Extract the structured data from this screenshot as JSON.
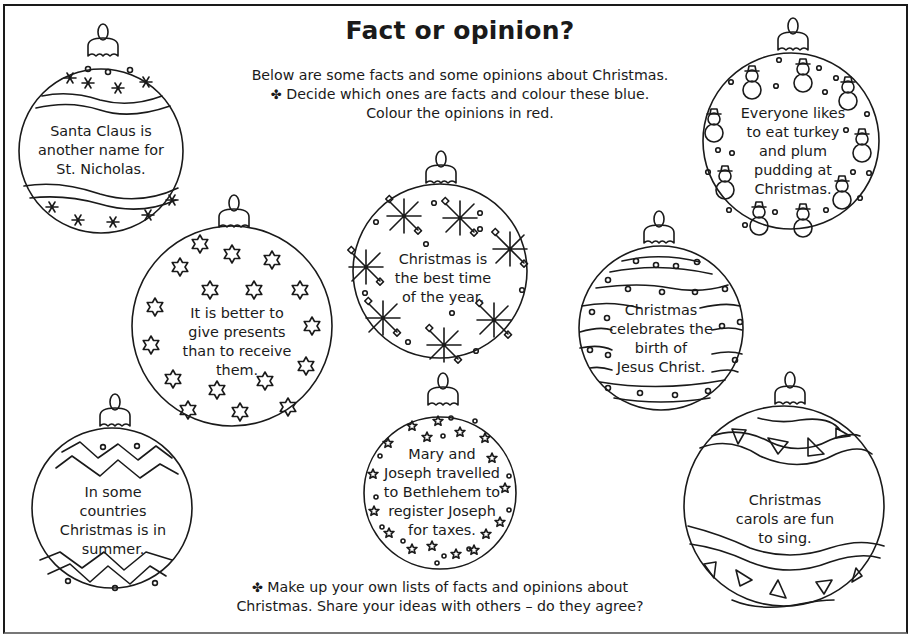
{
  "worksheet": {
    "title": "Fact or opinion?",
    "intro": {
      "line1": "Below are some facts and some opinions about Christmas.",
      "line2_icon": "✤",
      "line2": "Decide which ones are facts and colour these blue.",
      "line3": "Colour the opinions in red."
    },
    "outro": {
      "icon": "✤",
      "line1": "Make up your own lists of facts and opinions about",
      "line2": "Christmas. Share your ideas with others – do they agree?"
    },
    "colors": {
      "fact": "blue",
      "opinion": "red",
      "ink": "#1a1a1a"
    }
  },
  "baubles": [
    {
      "id": "santa",
      "pattern": "wavy-bands-asterisks",
      "text": "Santa Claus is\nanother name for\nSt. Nicholas."
    },
    {
      "id": "turkey",
      "pattern": "snowmen-dots",
      "text": "Everyone likes\nto eat turkey\nand plum\npudding at\nChristmas."
    },
    {
      "id": "presents",
      "pattern": "stars",
      "text": "It is better to\ngive presents\nthan to receive\nthem."
    },
    {
      "id": "best-time",
      "pattern": "snowflakes",
      "text": "Christmas is\nthe best time\nof the year."
    },
    {
      "id": "birth",
      "pattern": "striped-dots",
      "text": "Christmas\ncelebrates the\nbirth of\nJesus Christ."
    },
    {
      "id": "summer",
      "pattern": "zigzag",
      "text": "In some\ncountries\nChristmas is in\nsummer."
    },
    {
      "id": "bethlehem",
      "pattern": "small-stars",
      "text": "Mary and\nJoseph travelled\nto Bethlehem to\nregister Joseph\nfor taxes."
    },
    {
      "id": "carols",
      "pattern": "wavy-triangles",
      "text": "Christmas\ncarols are fun\nto sing."
    }
  ]
}
